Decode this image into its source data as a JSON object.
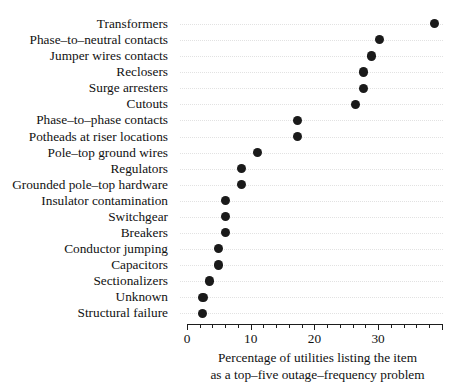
{
  "chart_data": {
    "type": "scatter",
    "title": "",
    "subtitle": "",
    "xlabel_line1": "Percentage of utilities listing the item",
    "xlabel_line2": "as a top–five outage–frequency problem",
    "ylabel": "",
    "xlim": [
      0,
      40
    ],
    "xticks": [
      0,
      10,
      20,
      30
    ],
    "xtick_labels": [
      "0",
      "10",
      "20",
      "30"
    ],
    "xminor_step": 2,
    "grid": true,
    "legend": "none",
    "orientation": "horizontal",
    "categories": [
      "Transformers",
      "Phase–to–neutral contacts",
      "Jumper wires contacts",
      "Reclosers",
      "Surge arresters",
      "Cutouts",
      "Phase–to–phase contacts",
      "Potheads at riser locations",
      "Pole–top ground wires",
      "Regulators",
      "Grounded pole–top hardware",
      "Insulator contamination",
      "Switchgear",
      "Breakers",
      "Conductor jumping",
      "Capacitors",
      "Sectionalizers",
      "Unknown",
      "Structural failure"
    ],
    "values": [
      38.8,
      30.2,
      29.0,
      27.7,
      27.7,
      26.4,
      17.4,
      17.4,
      11.1,
      8.5,
      8.6,
      6.1,
      6.1,
      6.1,
      4.9,
      4.9,
      3.5,
      2.5,
      2.4
    ]
  }
}
